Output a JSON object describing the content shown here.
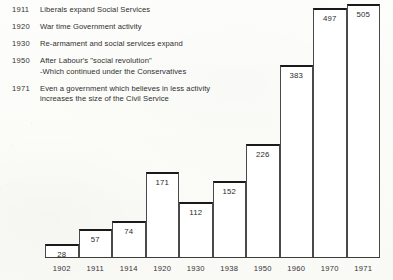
{
  "chart_data": {
    "type": "bar",
    "title": "",
    "subtitle": "",
    "xlabel": "",
    "ylabel": "",
    "categories": [
      "1902",
      "1911",
      "1914",
      "1920",
      "1930",
      "1938",
      "1950",
      "1960",
      "1970",
      "1971"
    ],
    "values": [
      28,
      57,
      74,
      171,
      112,
      152,
      226,
      383,
      497,
      505
    ],
    "value_labels": [
      "28",
      "57",
      "74",
      "171",
      "112",
      "152",
      "226",
      "383",
      "497",
      "505"
    ],
    "ylim": [
      0,
      512
    ],
    "grid": false,
    "legend": null,
    "annotations": [
      {
        "year": "1911",
        "text": "Liberals expand Social Services"
      },
      {
        "year": "1920",
        "text": "War time Government activity"
      },
      {
        "year": "1930",
        "text": "Re-armament and social services expand"
      },
      {
        "year": "1950",
        "text": "After Labour's \"social revolution\"\n-Which continued under the Conservatives"
      },
      {
        "year": "1971",
        "text": "Even a government which believes in less activity\nincreases the size of the Civil Service"
      }
    ],
    "colors": {
      "bar_fill": "#ffffff",
      "bar_top": "#1a1a1a",
      "bar_side": "#4a4a4a",
      "axis": "#3c3c3c",
      "text": "#2e2e2e",
      "background": "#fdfdfb"
    }
  }
}
